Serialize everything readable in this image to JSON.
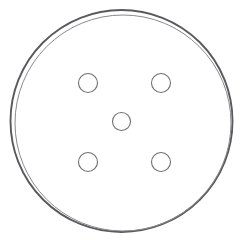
{
  "canvas": {
    "width": 243,
    "height": 249,
    "background_color": "#ffffff"
  },
  "figure": {
    "title": "Brake Drum",
    "view": "face-on plan view",
    "style": "technical line drawing, outline only, no fill"
  },
  "chart_data": {
    "type": "scatter",
    "xlabel": "",
    "ylabel": "",
    "grid": false,
    "legend": null,
    "xlim": [
      0,
      243
    ],
    "ylim": [
      0,
      249
    ],
    "shapes": [
      {
        "name": "outer-rim-circle",
        "kind": "circle",
        "cx": 121.5,
        "cy": 121.0,
        "r": 111.0,
        "stroke": "#5a5a5e",
        "stroke_width": 1.9,
        "fill": "none"
      },
      {
        "name": "inner-rim-circle",
        "kind": "circle",
        "cx": 123.0,
        "cy": 123.0,
        "r": 108.0,
        "stroke": "#8a8a8f",
        "stroke_width": 1.0,
        "fill": "none"
      },
      {
        "name": "center-hub-hole",
        "kind": "circle",
        "cx": 121.5,
        "cy": 121.5,
        "r": 9.0,
        "stroke": "#6f6f75",
        "stroke_width": 1.1,
        "fill": "none"
      },
      {
        "name": "bolt-hole-top-left",
        "kind": "circle",
        "cx": 88.0,
        "cy": 83.0,
        "r": 9.5,
        "stroke": "#6f6f75",
        "stroke_width": 1.1,
        "fill": "none"
      },
      {
        "name": "bolt-hole-top-right",
        "kind": "circle",
        "cx": 161.0,
        "cy": 83.0,
        "r": 9.5,
        "stroke": "#6f6f75",
        "stroke_width": 1.1,
        "fill": "none"
      },
      {
        "name": "bolt-hole-bottom-left",
        "kind": "circle",
        "cx": 88.0,
        "cy": 162.0,
        "r": 9.5,
        "stroke": "#6f6f75",
        "stroke_width": 1.1,
        "fill": "none"
      },
      {
        "name": "bolt-hole-bottom-right",
        "kind": "circle",
        "cx": 161.0,
        "cy": 162.0,
        "r": 9.5,
        "stroke": "#6f6f75",
        "stroke_width": 1.1,
        "fill": "none"
      }
    ],
    "counts": {
      "bolt_holes": 4,
      "center_holes": 1,
      "rim_outlines": 2
    }
  },
  "colors": {
    "background": "#ffffff",
    "outer_rim_stroke": "#5a5a5e",
    "inner_rim_stroke": "#8a8a8f",
    "hole_stroke": "#6f6f75"
  }
}
